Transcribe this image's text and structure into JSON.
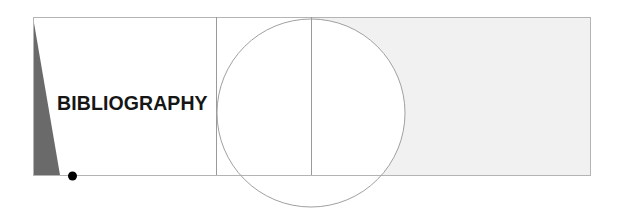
{
  "diagram": {
    "title": "BIBLIOGRAPHY",
    "colors": {
      "frame": "#b4b4b4",
      "triangle": "#6a6a6a",
      "shaded_panel": "#f2f2f2",
      "dot": "#000000",
      "circle": "#a0a0a0"
    }
  }
}
